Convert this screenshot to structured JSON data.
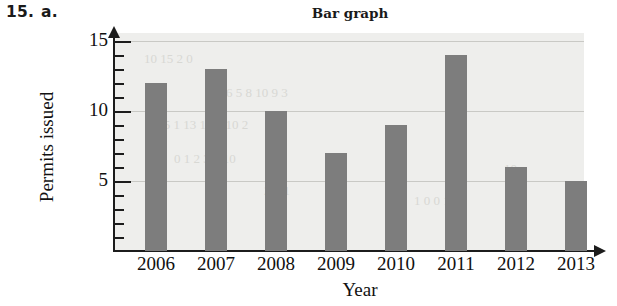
{
  "exercise": {
    "number": "15.",
    "part": "a."
  },
  "chart_data": {
    "type": "bar",
    "title": "Bar graph",
    "xlabel": "Year",
    "ylabel": "Permits issued",
    "categories": [
      "2006",
      "2007",
      "2008",
      "2009",
      "2010",
      "2011",
      "2012",
      "2013"
    ],
    "values": [
      12,
      13,
      10,
      7,
      9,
      14,
      6,
      5
    ],
    "ylim": [
      0,
      15.5
    ],
    "ytick_labels": [
      "5",
      "10",
      "15"
    ],
    "ytick_values": [
      5,
      10,
      15
    ],
    "minor_tick_step": 1,
    "grid": true,
    "grid_axis": "y",
    "legend": null,
    "bar_color": "#7d7d7d",
    "plot_background": "#eeeeec",
    "axis_color": "#1c1c1c",
    "gridline_color": "#c9c9c5"
  },
  "bleed_through": [
    {
      "text": "10   15          2 0",
      "x": 30,
      "y": 18
    },
    {
      "text": "6   5   8   10      9   3",
      "x": 112,
      "y": 52
    },
    {
      "text": "4 5 1  13 1    14    10   2",
      "x": 40,
      "y": 84
    },
    {
      "text": "0 1  2  3     8      10",
      "x": 60,
      "y": 118
    },
    {
      "text": "10",
      "x": 390,
      "y": 128
    },
    {
      "text": "1 0 0 1",
      "x": 300,
      "y": 160
    },
    {
      "text": "2 5 1",
      "x": 150,
      "y": 150
    }
  ]
}
